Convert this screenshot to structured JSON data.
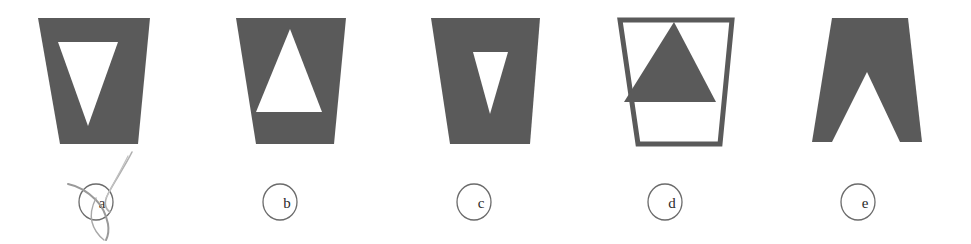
{
  "figure": {
    "background_color": "#ffffff",
    "shape_fill_color": "#5a5a5a",
    "shape_outline_color": "#5a5a5a",
    "cutout_color": "#ffffff",
    "label_circle_color": "#6b6b6b",
    "label_text_color": "#2a2a2a",
    "annotation_color": "#9a9a9a",
    "panel_count": 5
  },
  "panels": [
    {
      "id": "panel-a",
      "label": "a",
      "x": 0,
      "description": "dark trapezoid wider at top with white downward triangle in upper area",
      "trapezoid": {
        "fill": "#5a5a5a",
        "stroke": "none",
        "orientation": "wide-top"
      },
      "inner": {
        "shape": "triangle",
        "direction": "down",
        "fill": "#ffffff",
        "position": "upper"
      },
      "has_annotation": true
    },
    {
      "id": "panel-b",
      "label": "b",
      "x": 194,
      "description": "dark trapezoid wider at top with white upward triangle centered",
      "trapezoid": {
        "fill": "#5a5a5a",
        "stroke": "none",
        "orientation": "wide-top"
      },
      "inner": {
        "shape": "triangle",
        "direction": "up",
        "fill": "#ffffff",
        "position": "center"
      },
      "has_annotation": false
    },
    {
      "id": "panel-c",
      "label": "c",
      "x": 388,
      "description": "dark trapezoid wider at top with small white downward triangle, right of center",
      "trapezoid": {
        "fill": "#5a5a5a",
        "stroke": "none",
        "orientation": "wide-top"
      },
      "inner": {
        "shape": "triangle",
        "direction": "down",
        "fill": "#ffffff",
        "position": "upper-right-of-center"
      },
      "has_annotation": false
    },
    {
      "id": "panel-d",
      "label": "d",
      "x": 582,
      "description": "outlined white trapezoid with dark filled upward triangle whose base overhangs the sides",
      "trapezoid": {
        "fill": "#ffffff",
        "stroke": "#5a5a5a",
        "orientation": "wide-top"
      },
      "inner": {
        "shape": "triangle",
        "direction": "up",
        "fill": "#5a5a5a",
        "position": "upper"
      },
      "has_annotation": false
    },
    {
      "id": "panel-e",
      "label": "e",
      "x": 776,
      "description": "dark trapezoid wider at bottom with white upward triangle reaching the bottom edge",
      "trapezoid": {
        "fill": "#5a5a5a",
        "stroke": "none",
        "orientation": "wide-bottom"
      },
      "inner": {
        "shape": "triangle",
        "direction": "up",
        "fill": "#ffffff",
        "position": "lower"
      },
      "has_annotation": false
    }
  ],
  "annotation": {
    "name": "hand-drawn-scribble",
    "over_label": "a",
    "color": "#9a9a9a"
  }
}
